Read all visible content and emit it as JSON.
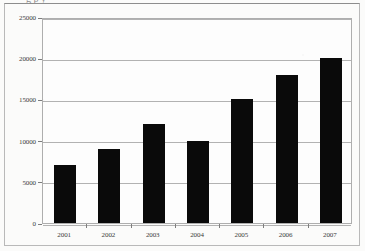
{
  "figure": {
    "background_color": "#fbfbfa",
    "border_color": "#b9b9b9",
    "plot_background_color": "#fdfdfd",
    "plot_border_color": "#aeaeae",
    "gridline_color": "#b2b2b2",
    "bar_color": "#0a0a0a",
    "tick_color": "#7d7d7d",
    "label_color": "#3b3b3b",
    "cropped_text_remnant": "g                                                        p     y"
  },
  "chart_data": {
    "type": "bar",
    "title": "",
    "subtitle": "",
    "xlabel": "",
    "ylabel": "",
    "categories": [
      "2001",
      "2002",
      "2003",
      "2004",
      "2005",
      "2006",
      "2007"
    ],
    "values": [
      7000,
      9000,
      12000,
      10000,
      15000,
      18000,
      20000
    ],
    "series": [
      {
        "name": "",
        "values": [
          7000,
          9000,
          12000,
          10000,
          15000,
          18000,
          20000
        ]
      }
    ],
    "ylim": [
      0,
      25000
    ],
    "ytick_values": [
      0,
      5000,
      10000,
      15000,
      20000,
      25000
    ],
    "ytick_labels": [
      "0",
      "5000",
      "10000",
      "15000",
      "20000",
      "25000"
    ],
    "xtick_labels": [
      "2001",
      "2002",
      "2003",
      "2004",
      "2005",
      "2006",
      "2007"
    ],
    "grid": true,
    "grid_axis": "y",
    "legend": false,
    "legend_position": "none",
    "annotations": []
  }
}
